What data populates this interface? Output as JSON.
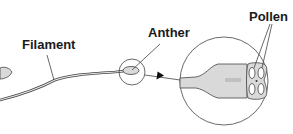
{
  "diagram": {
    "labels": {
      "filament": "Filament",
      "anther": "Anther",
      "pollen": "Pollen"
    },
    "colors": {
      "stroke": "#333333",
      "fill": "#d9d9d9",
      "background": "#ffffff"
    }
  }
}
